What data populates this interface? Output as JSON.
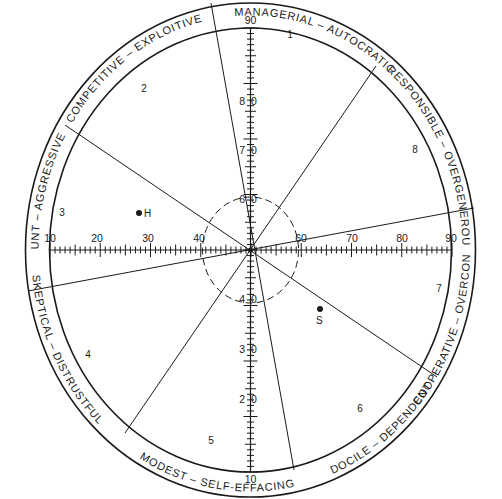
{
  "diagram": {
    "colors": {
      "ink": "#1a1a1a",
      "background": "#ffffff"
    },
    "center": {
      "x": 250.5,
      "y": 250
    },
    "outer_ellipse": {
      "rx": 225,
      "ry": 247
    },
    "inner_ellipse": {
      "rx": 201,
      "ry": 222
    },
    "dashed_circle": {
      "rx": 48,
      "ry": 53
    },
    "octants": [
      {
        "number": "1",
        "label": "MANAGERIAL  –  AUTOCRATIC",
        "num_pos": {
          "x": 290,
          "y": 50
        }
      },
      {
        "number": "2",
        "label": "COMPETITIVE  –  EXPLOITIVE",
        "num_pos": {
          "x": 144,
          "y": 92
        }
      },
      {
        "number": "3",
        "label": "BLUNT  –  AGGRESSIVE",
        "num_pos": {
          "x": 62,
          "y": 216
        }
      },
      {
        "number": "4",
        "label": "SKEPTICAL  –  DISTRUSTFUL",
        "num_pos": {
          "x": 89,
          "y": 358
        }
      },
      {
        "number": "5",
        "label": "MODEST  –  SELF-EFFACING",
        "num_pos": {
          "x": 210,
          "y": 444
        }
      },
      {
        "number": "6",
        "label": "DOCILE  –  DEPENDENT",
        "num_pos": {
          "x": 360,
          "y": 411
        }
      },
      {
        "number": "7",
        "label": "COOPERATIVE  –  OVERCONVENTIONAL",
        "num_pos": {
          "x": 438,
          "y": 292
        }
      },
      {
        "number": "8",
        "label": "RESPONSIBLE  –  OVERGENEROUS",
        "num_pos": {
          "x": 415,
          "y": 152
        }
      }
    ],
    "horizontal_axis": {
      "labels": [
        "10",
        "20",
        "30",
        "40",
        "60",
        "70",
        "80",
        "90"
      ],
      "values": [
        10,
        20,
        30,
        40,
        60,
        70,
        80,
        90
      ]
    },
    "vertical_axis": {
      "labels": [
        "90",
        "80",
        "70",
        "60",
        "40",
        "30",
        "20",
        "10"
      ],
      "values": [
        90,
        80,
        70,
        60,
        40,
        30,
        20,
        10
      ]
    },
    "points": [
      {
        "label": "H",
        "x_value": 27.7,
        "y_value": 56.7
      },
      {
        "label": "S",
        "x_value": 63.7,
        "y_value": 39.4
      }
    ]
  }
}
